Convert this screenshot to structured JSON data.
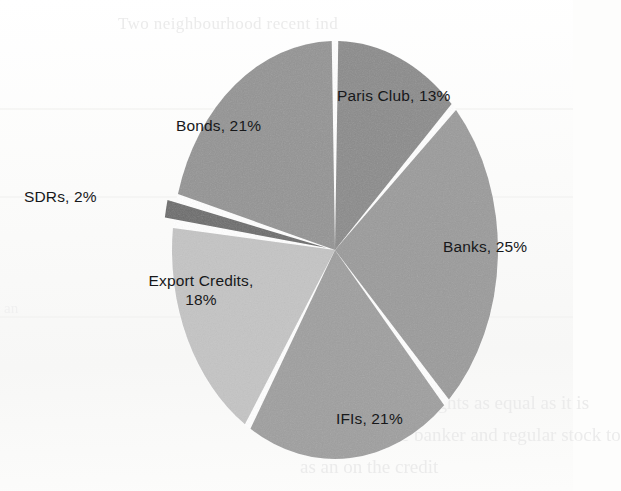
{
  "page": {
    "background_color": "#fbfbfa",
    "ghost_text": {
      "top": "Two neighbourhood recent ind",
      "bottom_line_1": "net rights as equal as it is",
      "bottom_line_2": "the banker and regular stock to",
      "bottom_line_3": "as an on the credit",
      "left": "an"
    }
  },
  "chart_data": {
    "type": "pie",
    "title": "",
    "legend_position": "inside-slices",
    "start_angle_deg": 0,
    "direction": "clockwise",
    "colors": {
      "paris_club": "#8b8b8b",
      "banks": "#9b9b9b",
      "ifis": "#9f9f9f",
      "export_credits": "#c4c4c4",
      "sdrs": "#6c6c6c",
      "bonds": "#949494",
      "separator": "#ffffff"
    },
    "categories": [
      "Paris Club",
      "Banks",
      "IFIs",
      "Export Credits",
      "SDRs",
      "Bonds"
    ],
    "values": [
      13,
      25,
      21,
      18,
      2,
      21
    ],
    "unit": "%",
    "slices": [
      {
        "name": "Paris Club",
        "value": 13,
        "label": "Paris Club, 13%",
        "color": "#8b8b8b",
        "exploded": false
      },
      {
        "name": "Banks",
        "value": 25,
        "label": "Banks, 25%",
        "color": "#9b9b9b",
        "exploded": false
      },
      {
        "name": "IFIs",
        "value": 21,
        "label": "IFIs, 21%",
        "color": "#9f9f9f",
        "exploded": false
      },
      {
        "name": "Export Credits",
        "value": 18,
        "label_line_1": "Export Credits,",
        "label_line_2": "18%",
        "color": "#c4c4c4",
        "exploded": false
      },
      {
        "name": "SDRs",
        "value": 2,
        "label": "SDRs, 2%",
        "color": "#6c6c6c",
        "exploded": true
      },
      {
        "name": "Bonds",
        "value": 21,
        "label": "Bonds, 21%",
        "color": "#949494",
        "exploded": false
      }
    ]
  }
}
